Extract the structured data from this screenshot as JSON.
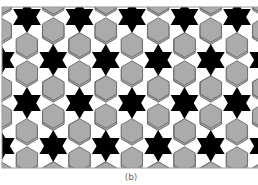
{
  "figure": {
    "caption": "(b)",
    "frame": {
      "x": 2,
      "y": 7,
      "width": 262,
      "height": 161
    },
    "colors": {
      "background": "#ffffff",
      "star": "#000000",
      "hexagon_fill": "#ababab",
      "hexagon_stroke": "#6c6c6c",
      "frame": "#9a9a9a",
      "caption": "#6a6a6a"
    },
    "lattice": {
      "horizontal_period": 52.5,
      "row_step": 43,
      "first_row_y": 17,
      "row_x_offsets": [
        27,
        53.25
      ],
      "rows": 5
    },
    "star": {
      "outer_radius": 16,
      "inner_radius": 9.2
    },
    "hexagon": {
      "circumradius": 12.2,
      "ring_distance": 30
    }
  }
}
